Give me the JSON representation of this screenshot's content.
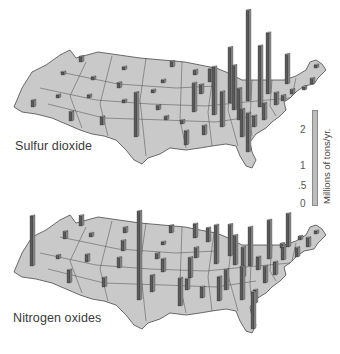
{
  "chart_data": [
    {
      "type": "map-bar-3d",
      "title": "Sulfur dioxide",
      "unit": "Millions of tons/yr.",
      "scale_ticks": [
        "0",
        ".5",
        "1",
        "2"
      ],
      "ylim": [
        0,
        2.3
      ],
      "bars": [
        {
          "region": "Washington",
          "x": 79,
          "base": 62,
          "value": 0.15
        },
        {
          "region": "Oregon",
          "x": 61,
          "base": 75,
          "value": 0.08
        },
        {
          "region": "California",
          "x": 31,
          "base": 107,
          "value": 0.18
        },
        {
          "region": "Idaho",
          "x": 91,
          "base": 80,
          "value": 0.05
        },
        {
          "region": "Montana",
          "x": 122,
          "base": 70,
          "value": 0.08
        },
        {
          "region": "Nevada",
          "x": 56,
          "base": 98,
          "value": 0.06
        },
        {
          "region": "Utah",
          "x": 87,
          "base": 98,
          "value": 0.05
        },
        {
          "region": "Wyoming",
          "x": 117,
          "base": 88,
          "value": 0.14
        },
        {
          "region": "Arizona",
          "x": 69,
          "base": 121,
          "value": 0.25
        },
        {
          "region": "Colorado",
          "x": 122,
          "base": 103,
          "value": 0.08
        },
        {
          "region": "New Mexico",
          "x": 100,
          "base": 125,
          "value": 0.22
        },
        {
          "region": "North Dakota",
          "x": 170,
          "base": 67,
          "value": 0.15
        },
        {
          "region": "South Dakota",
          "x": 161,
          "base": 83,
          "value": 0.05
        },
        {
          "region": "Nebraska",
          "x": 151,
          "base": 93,
          "value": 0.06
        },
        {
          "region": "Kansas",
          "x": 156,
          "base": 110,
          "value": 0.12
        },
        {
          "region": "Oklahoma",
          "x": 164,
          "base": 120,
          "value": 0.1
        },
        {
          "region": "Texas",
          "x": 134,
          "base": 137,
          "value": 1.2
        },
        {
          "region": "Minnesota",
          "x": 193,
          "base": 75,
          "value": 0.13
        },
        {
          "region": "Iowa",
          "x": 192,
          "base": 112,
          "value": 0.78
        },
        {
          "region": "Missouri",
          "x": 199,
          "base": 94,
          "value": 0.25
        },
        {
          "region": "Arkansas",
          "x": 180,
          "base": 124,
          "value": 0.1
        },
        {
          "region": "Louisiana",
          "x": 184,
          "base": 145,
          "value": 0.38
        },
        {
          "region": "Wisconsin",
          "x": 208,
          "base": 82,
          "value": 0.35
        },
        {
          "region": "Illinois",
          "x": 212,
          "base": 115,
          "value": 1.3
        },
        {
          "region": "Mississippi",
          "x": 202,
          "base": 135,
          "value": 0.25
        },
        {
          "region": "Michigan",
          "x": 228,
          "base": 103,
          "value": 1.5
        },
        {
          "region": "Indiana",
          "x": 232,
          "base": 110,
          "value": 1.2
        },
        {
          "region": "Kentucky",
          "x": 237,
          "base": 120,
          "value": 0.85
        },
        {
          "region": "Tennessee",
          "x": 220,
          "base": 127,
          "value": 0.95
        },
        {
          "region": "Alabama",
          "x": 240,
          "base": 137,
          "value": 0.75
        },
        {
          "region": "Georgia",
          "x": 246,
          "base": 152,
          "value": 1.05
        },
        {
          "region": "Ohio",
          "x": 246,
          "base": 101,
          "value": 2.45
        },
        {
          "region": "West Virginia",
          "x": 258,
          "base": 107,
          "value": 1.65
        },
        {
          "region": "Pennsylvania",
          "x": 266,
          "base": 94,
          "value": 1.65
        },
        {
          "region": "Virginia",
          "x": 262,
          "base": 120,
          "value": 0.45
        },
        {
          "region": "North Carolina",
          "x": 252,
          "base": 127,
          "value": 0.3
        },
        {
          "region": "New York",
          "x": 285,
          "base": 84,
          "value": 0.8
        },
        {
          "region": "Maryland",
          "x": 274,
          "base": 105,
          "value": 0.33
        },
        {
          "region": "Delaware",
          "x": 281,
          "base": 101,
          "value": 0.15
        },
        {
          "region": "New Jersey",
          "x": 290,
          "base": 94,
          "value": 0.12
        },
        {
          "region": "Massachusetts",
          "x": 310,
          "base": 84,
          "value": 0.15
        },
        {
          "region": "Connecticut",
          "x": 302,
          "base": 90,
          "value": 0.08
        },
        {
          "region": "Maine",
          "x": 314,
          "base": 68,
          "value": 0.05
        }
      ]
    },
    {
      "type": "map-bar-3d",
      "title": "Nitrogen oxides",
      "unit": "Millions of tons/yr.",
      "scale_ticks": [
        "0",
        ".5",
        "1",
        "2"
      ],
      "ylim": [
        0,
        2.3
      ],
      "bars": [
        {
          "region": "California",
          "x": 30,
          "base": 266,
          "value": 1.35
        },
        {
          "region": "Washington",
          "x": 79,
          "base": 226,
          "value": 0.28
        },
        {
          "region": "Oregon",
          "x": 63,
          "base": 239,
          "value": 0.2
        },
        {
          "region": "Idaho",
          "x": 89,
          "base": 237,
          "value": 0.1
        },
        {
          "region": "Nevada",
          "x": 56,
          "base": 259,
          "value": 0.1
        },
        {
          "region": "Utah",
          "x": 85,
          "base": 262,
          "value": 0.2
        },
        {
          "region": "Arizona",
          "x": 67,
          "base": 283,
          "value": 0.35
        },
        {
          "region": "New Mexico",
          "x": 102,
          "base": 287,
          "value": 0.25
        },
        {
          "region": "Montana",
          "x": 123,
          "base": 233,
          "value": 0.15
        },
        {
          "region": "Wyoming",
          "x": 121,
          "base": 251,
          "value": 0.28
        },
        {
          "region": "Colorado",
          "x": 117,
          "base": 268,
          "value": 0.28
        },
        {
          "region": "Texas",
          "x": 137,
          "base": 300,
          "value": 2.4
        },
        {
          "region": "North Dakota",
          "x": 169,
          "base": 233,
          "value": 0.2
        },
        {
          "region": "South Dakota",
          "x": 161,
          "base": 245,
          "value": 0.08
        },
        {
          "region": "Nebraska",
          "x": 155,
          "base": 259,
          "value": 0.15
        },
        {
          "region": "Kansas",
          "x": 161,
          "base": 272,
          "value": 0.35
        },
        {
          "region": "Oklahoma",
          "x": 150,
          "base": 292,
          "value": 0.45
        },
        {
          "region": "Minnesota",
          "x": 193,
          "base": 238,
          "value": 0.38
        },
        {
          "region": "Iowa",
          "x": 194,
          "base": 258,
          "value": 0.28
        },
        {
          "region": "Missouri",
          "x": 188,
          "base": 278,
          "value": 0.55
        },
        {
          "region": "Arkansas",
          "x": 185,
          "base": 290,
          "value": 0.3
        },
        {
          "region": "Louisiana",
          "x": 178,
          "base": 306,
          "value": 0.75
        },
        {
          "region": "Wisconsin",
          "x": 206,
          "base": 242,
          "value": 0.38
        },
        {
          "region": "Illinois",
          "x": 214,
          "base": 264,
          "value": 1.05
        },
        {
          "region": "Mississippi",
          "x": 200,
          "base": 298,
          "value": 0.3
        },
        {
          "region": "Michigan",
          "x": 228,
          "base": 256,
          "value": 0.85
        },
        {
          "region": "Indiana",
          "x": 233,
          "base": 265,
          "value": 0.8
        },
        {
          "region": "Alabama",
          "x": 217,
          "base": 301,
          "value": 0.65
        },
        {
          "region": "Tennessee",
          "x": 224,
          "base": 290,
          "value": 0.55
        },
        {
          "region": "Kentucky",
          "x": 241,
          "base": 277,
          "value": 0.8
        },
        {
          "region": "Georgia",
          "x": 240,
          "base": 300,
          "value": 0.9
        },
        {
          "region": "Florida",
          "x": 251,
          "base": 329,
          "value": 1.0
        },
        {
          "region": "Ohio",
          "x": 248,
          "base": 266,
          "value": 1.05
        },
        {
          "region": "West Virginia",
          "x": 256,
          "base": 270,
          "value": 0.35
        },
        {
          "region": "Pennsylvania",
          "x": 267,
          "base": 259,
          "value": 1.05
        },
        {
          "region": "Virginia",
          "x": 263,
          "base": 283,
          "value": 0.45
        },
        {
          "region": "North Carolina",
          "x": 253,
          "base": 303,
          "value": 0.35
        },
        {
          "region": "New York",
          "x": 286,
          "base": 247,
          "value": 0.9
        },
        {
          "region": "Maryland",
          "x": 273,
          "base": 275,
          "value": 0.35
        },
        {
          "region": "New Jersey",
          "x": 281,
          "base": 260,
          "value": 0.35
        },
        {
          "region": "Delaware",
          "x": 280,
          "base": 248,
          "value": 0.12
        },
        {
          "region": "Connecticut",
          "x": 295,
          "base": 257,
          "value": 0.25
        },
        {
          "region": "Massachusetts",
          "x": 306,
          "base": 247,
          "value": 0.25
        },
        {
          "region": "Rhode Island",
          "x": 298,
          "base": 240,
          "value": 0.1
        },
        {
          "region": "Maine",
          "x": 314,
          "base": 234,
          "value": 0.05
        }
      ]
    }
  ],
  "labels": {
    "top_map": "Sulfur dioxide",
    "bottom_map": "Nitrogen oxides",
    "scale_title": "Millions of tons/yr.",
    "tick_2": "2",
    "tick_1": "1",
    "tick_half": ".5",
    "tick_0": "0"
  },
  "colors": {
    "land": "#c9c9c9",
    "border": "#4a4a4a",
    "bar_front": "#5a5a5a",
    "bar_side": "#8c8c8c",
    "bar_top": "#b0b0b0",
    "scale_bar": "#bdbdbd"
  }
}
